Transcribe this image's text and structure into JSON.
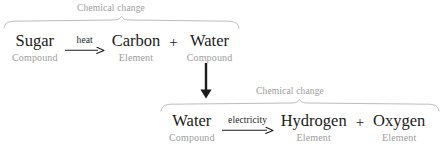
{
  "diagram": {
    "colors": {
      "text_primary": "#1b1b1b",
      "text_muted": "#9d9d9d",
      "brace": "#b4b4b4",
      "arrow": "#1b1b1b",
      "background": "#ffffff"
    },
    "braces": [
      {
        "caption": "Chemical change"
      },
      {
        "caption": "Chemical change"
      }
    ],
    "rows": [
      {
        "id": "row-top",
        "reactant": {
          "name": "Sugar",
          "classification": "Compound"
        },
        "arrow_label": "heat",
        "products": [
          {
            "name": "Carbon",
            "classification": "Element"
          },
          {
            "name": "Water",
            "classification": "Compound"
          }
        ],
        "plus": "+"
      },
      {
        "id": "row-bottom",
        "reactant": {
          "name": "Water",
          "classification": "Compound"
        },
        "arrow_label": "electricity",
        "products": [
          {
            "name": "Hydrogen",
            "classification": "Element"
          },
          {
            "name": "Oxygen",
            "classification": "Element"
          }
        ],
        "plus": "+"
      }
    ]
  }
}
